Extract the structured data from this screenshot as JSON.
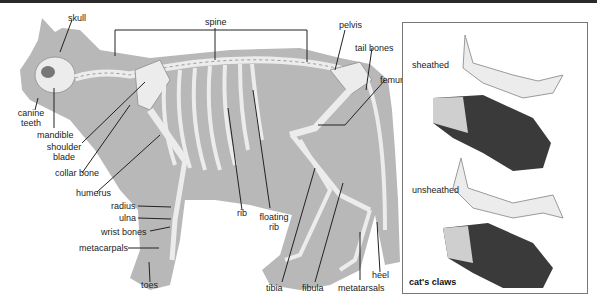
{
  "figure": {
    "labels": {
      "skull": "skull",
      "spine": "spine",
      "pelvis": "pelvis",
      "tail_bones": "tail bones",
      "femur": "femur",
      "canine_teeth_1": "canine",
      "canine_teeth_2": "teeth",
      "mandible": "mandible",
      "shoulder_blade_1": "shoulder",
      "shoulder_blade_2": "blade",
      "collar_bone": "collar bone",
      "humerus": "humerus",
      "radius": "radius",
      "ulna": "ulna",
      "wrist_bones": "wrist bones",
      "metacarpals": "metacarpals",
      "toes": "toes",
      "rib": "rib",
      "floating_rib_1": "floating",
      "floating_rib_2": "rib",
      "tibia": "tibia",
      "fibula": "fibula",
      "metatarsals": "metatarsals",
      "heel": "heel"
    }
  },
  "inset": {
    "title": "cat's claws",
    "sheathed": "sheathed",
    "unsheathed": "unsheathed"
  },
  "colors": {
    "body": "#b8b8b8",
    "bone": "#ececec",
    "bone_outline": "#9a9a9a",
    "paw_dark": "#3a3a3a",
    "leader_line": "#222222"
  }
}
